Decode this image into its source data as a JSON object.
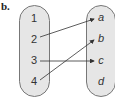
{
  "label": "b.",
  "domain_set": {
    "items": [
      {
        "text": "1",
        "y": 14
      },
      {
        "text": "2",
        "y": 35
      },
      {
        "text": "3",
        "y": 56
      },
      {
        "text": "4",
        "y": 77
      }
    ]
  },
  "range_set": {
    "items": [
      {
        "text": "a",
        "y": 13
      },
      {
        "text": "b",
        "y": 34
      },
      {
        "text": "c",
        "y": 56
      },
      {
        "text": "d",
        "y": 77
      }
    ]
  },
  "mappings": [
    {
      "from": "2",
      "to": "a"
    },
    {
      "from": "3",
      "to": "c"
    },
    {
      "from": "4",
      "to": "b"
    }
  ],
  "colors": {
    "oval_fill": "#e6e6e6",
    "oval_stroke": "#777777",
    "arrow": "#333333"
  }
}
